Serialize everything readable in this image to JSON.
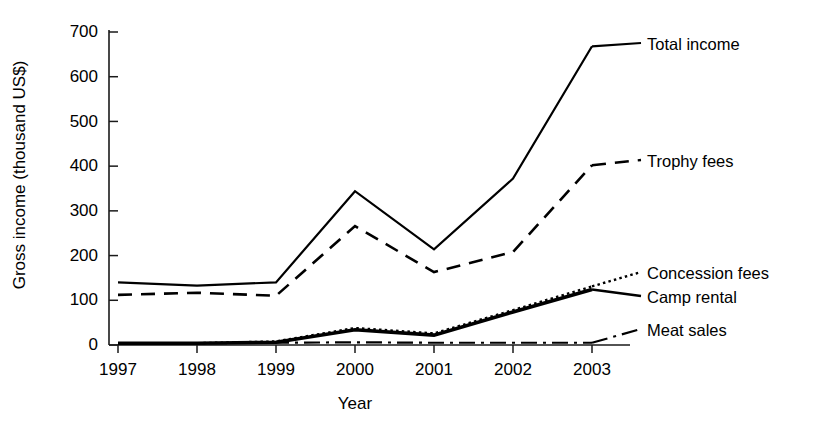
{
  "chart_data": {
    "type": "line",
    "title": "",
    "xlabel": "Year",
    "ylabel": "Gross income (thousand US$)",
    "categories": [
      "1997",
      "1998",
      "1999",
      "2000",
      "2001",
      "2002",
      "2003"
    ],
    "x": [
      1997,
      1998,
      1999,
      2000,
      2001,
      2002,
      2003
    ],
    "ylim": [
      0,
      700
    ],
    "yticks": [
      0,
      100,
      200,
      300,
      400,
      500,
      600,
      700
    ],
    "ytick_labels": [
      "0",
      "100",
      "200",
      "300",
      "400",
      "500",
      "600",
      "700"
    ],
    "grid": false,
    "legend_position": "right-inline-labels",
    "series": [
      {
        "name": "Total income",
        "style": "solid",
        "color": "#000000",
        "values": [
          140,
          133,
          140,
          344,
          214,
          372,
          668
        ]
      },
      {
        "name": "Trophy fees",
        "style": "dashed",
        "color": "#000000",
        "values": [
          112,
          117,
          110,
          266,
          163,
          208,
          402
        ]
      },
      {
        "name": "Concession fees",
        "style": "dotted",
        "color": "#000000",
        "values": [
          4,
          4,
          8,
          38,
          26,
          78,
          131
        ]
      },
      {
        "name": "Camp rental",
        "style": "solid-thick",
        "color": "#000000",
        "values": [
          4,
          4,
          6,
          34,
          22,
          74,
          124
        ]
      },
      {
        "name": "Meat sales",
        "style": "dash-dot",
        "color": "#000000",
        "values": [
          4,
          4,
          5,
          6,
          5,
          5,
          5
        ]
      }
    ],
    "annotations": [
      {
        "text": "Total income",
        "series": "Total income"
      },
      {
        "text": "Trophy fees",
        "series": "Trophy fees"
      },
      {
        "text": "Concession fees",
        "series": "Concession fees"
      },
      {
        "text": "Camp rental",
        "series": "Camp rental"
      },
      {
        "text": "Meat sales",
        "series": "Meat sales"
      }
    ]
  },
  "axes": {
    "ylabel": "Gross income (thousand US$)",
    "xlabel": "Year",
    "ytick_labels": [
      "700",
      "600",
      "500",
      "400",
      "300",
      "200",
      "100",
      "0"
    ],
    "xtick_labels": [
      "1997",
      "1998",
      "1999",
      "2000",
      "2001",
      "2002",
      "2003"
    ]
  },
  "series_labels": {
    "total_income": "Total income",
    "trophy_fees": "Trophy fees",
    "concession_fees": "Concession fees",
    "camp_rental": "Camp rental",
    "meat_sales": "Meat sales"
  }
}
